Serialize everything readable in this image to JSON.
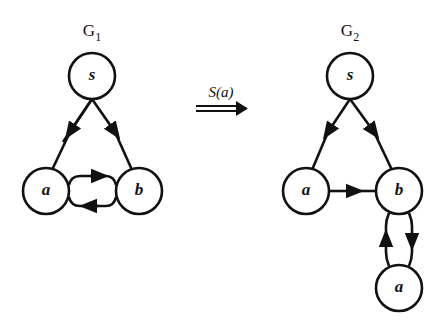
{
  "graphs": [
    {
      "title": "G",
      "subscript": "1",
      "nodes": [
        {
          "id": "s",
          "label": "s",
          "x": 92,
          "y": 76
        },
        {
          "id": "a",
          "label": "a",
          "x": 46,
          "y": 191
        },
        {
          "id": "b",
          "label": "b",
          "x": 139,
          "y": 191
        }
      ],
      "edges": [
        {
          "from": "s",
          "to": "a"
        },
        {
          "from": "s",
          "to": "b"
        },
        {
          "from": "a",
          "to": "b"
        },
        {
          "from": "b",
          "to": "a"
        }
      ]
    },
    {
      "title": "G",
      "subscript": "2",
      "nodes": [
        {
          "id": "s",
          "label": "s",
          "x": 350,
          "y": 76
        },
        {
          "id": "a",
          "label": "a",
          "x": 306,
          "y": 191
        },
        {
          "id": "b",
          "label": "b",
          "x": 399,
          "y": 191
        },
        {
          "id": "a2",
          "label": "a",
          "x": 399,
          "y": 288
        }
      ],
      "edges": [
        {
          "from": "s",
          "to": "a"
        },
        {
          "from": "s",
          "to": "b"
        },
        {
          "from": "a",
          "to": "b"
        },
        {
          "from": "b",
          "to": "a2"
        },
        {
          "from": "a2",
          "to": "b"
        }
      ]
    }
  ],
  "transformation": {
    "label": "S(a)",
    "arrow": "double-right-arrow"
  }
}
